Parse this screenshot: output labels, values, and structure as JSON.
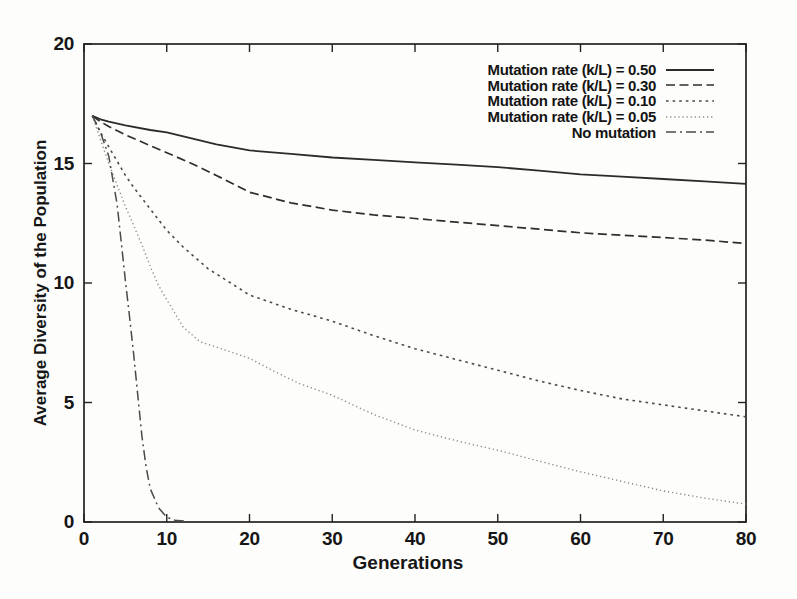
{
  "figure": {
    "background_color": "#fdfdfb",
    "ink_color": "#222222"
  },
  "chart_data": {
    "type": "line",
    "title": "",
    "xlabel": "Generations",
    "ylabel": "Average Diversity of the Population",
    "xlim": [
      0,
      80
    ],
    "ylim": [
      0,
      20
    ],
    "x_ticks": [
      "0",
      "10",
      "20",
      "30",
      "40",
      "50",
      "60",
      "70",
      "80"
    ],
    "x_tick_values": [
      0,
      10,
      20,
      30,
      40,
      50,
      60,
      70,
      80
    ],
    "y_ticks": [
      "0",
      "5",
      "10",
      "15",
      "20"
    ],
    "y_tick_values": [
      0,
      5,
      10,
      15,
      20
    ],
    "grid": false,
    "legend_position": "top-right-inside",
    "series": [
      {
        "name": "Mutation rate (k/L) = 0.50",
        "line_style": "solid",
        "color": "#2b2b2b",
        "x": [
          1,
          2,
          3,
          5,
          8,
          10,
          13,
          16,
          20,
          25,
          30,
          35,
          40,
          45,
          50,
          55,
          60,
          65,
          70,
          75,
          80
        ],
        "y": [
          17,
          16.85,
          16.75,
          16.6,
          16.4,
          16.3,
          16.05,
          15.8,
          15.55,
          15.4,
          15.25,
          15.15,
          15.05,
          14.95,
          14.85,
          14.7,
          14.55,
          14.45,
          14.35,
          14.25,
          14.15
        ]
      },
      {
        "name": "Mutation rate (k/L) = 0.30",
        "line_style": "dashed",
        "color": "#2e2e2e",
        "x": [
          1,
          2,
          3,
          5,
          8,
          10,
          13,
          16,
          20,
          25,
          30,
          35,
          40,
          45,
          50,
          55,
          60,
          65,
          70,
          75,
          80
        ],
        "y": [
          17,
          16.75,
          16.55,
          16.2,
          15.75,
          15.45,
          15.0,
          14.5,
          13.8,
          13.35,
          13.05,
          12.85,
          12.7,
          12.55,
          12.4,
          12.25,
          12.1,
          12.0,
          11.9,
          11.8,
          11.65
        ]
      },
      {
        "name": "Mutation rate (k/L) = 0.10",
        "line_style": "dotted",
        "color": "#4a4a4a",
        "x": [
          1,
          2,
          3,
          4,
          5,
          6,
          8,
          10,
          12,
          15,
          20,
          25,
          30,
          35,
          40,
          45,
          50,
          55,
          60,
          65,
          70,
          75,
          80
        ],
        "y": [
          17,
          16.3,
          15.7,
          15.1,
          14.5,
          14.0,
          13.1,
          12.2,
          11.5,
          10.6,
          9.5,
          8.9,
          8.4,
          7.8,
          7.25,
          6.8,
          6.35,
          5.9,
          5.5,
          5.15,
          4.9,
          4.65,
          4.4
        ]
      },
      {
        "name": "Mutation rate (k/L) = 0.05",
        "line_style": "fine-dotted",
        "color": "#8e8e8e",
        "x": [
          1,
          2,
          3,
          4,
          5,
          6,
          7,
          8,
          9,
          10,
          12,
          14,
          17,
          20,
          23,
          26,
          30,
          35,
          40,
          45,
          50,
          55,
          60,
          65,
          70,
          75,
          80
        ],
        "y": [
          17,
          16.0,
          15.0,
          14.1,
          13.2,
          12.4,
          11.6,
          10.7,
          9.9,
          9.3,
          8.15,
          7.55,
          7.2,
          6.85,
          6.3,
          5.8,
          5.3,
          4.5,
          3.85,
          3.4,
          3.0,
          2.55,
          2.1,
          1.7,
          1.3,
          1.0,
          0.75
        ]
      },
      {
        "name": "No mutation",
        "line_style": "dash-dot",
        "color": "#4a4a4a",
        "x": [
          1,
          2,
          3,
          4,
          5,
          5.5,
          6,
          6.5,
          7,
          7.5,
          8,
          9,
          10,
          11,
          12.5
        ],
        "y": [
          17,
          16.3,
          15.3,
          13.3,
          10.1,
          8.6,
          7.0,
          5.3,
          3.6,
          2.3,
          1.4,
          0.6,
          0.2,
          0.07,
          0.03
        ]
      }
    ]
  }
}
